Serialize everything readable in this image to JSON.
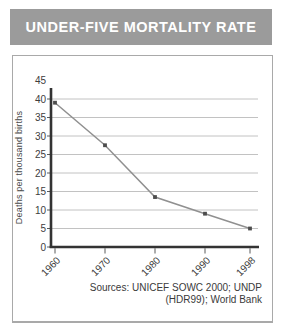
{
  "header": {
    "title": "UNDER-FIVE MORTALITY RATE"
  },
  "chart_data": {
    "type": "line",
    "title": "UNDER-FIVE MORTALITY RATE",
    "categories": [
      "1960",
      "1970",
      "1980",
      "1990",
      "1998"
    ],
    "values": [
      39,
      27.5,
      13.5,
      9,
      5
    ],
    "xlabel": "",
    "ylabel": "Deaths per thousand births",
    "ylim": [
      0,
      45
    ],
    "ytick_step": 5,
    "grid": true,
    "legend": false,
    "colors": {
      "line": "#909090",
      "marker": "#4d4d4d",
      "axis": "#333333",
      "gridline": "#b2b2b2",
      "tick_label": "#3d3d3d"
    }
  },
  "source": {
    "line1": "Sources: UNICEF SOWC 2000; UNDP",
    "line2": "(HDR99); World Bank"
  },
  "colors": {
    "header_bg": "#9b9b9b",
    "header_text": "#ffffff",
    "box_border": "#a9a9a9"
  }
}
